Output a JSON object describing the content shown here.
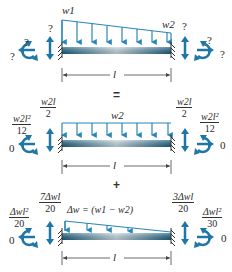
{
  "colors": {
    "beam": "#1f6b8e",
    "load": "#2a86b8",
    "reaction": "#1e76a6",
    "text": "#2a2a2a"
  },
  "operators": {
    "equals": "=",
    "plus": "+"
  },
  "panels": [
    {
      "id": "original",
      "load_type": "trapezoidal",
      "load_labels": {
        "left": "w1",
        "right": "w2"
      },
      "left_support": {
        "vertical": "?",
        "moment": "?",
        "horizontal": "?"
      },
      "right_support": {
        "vertical": "?",
        "moment": "?",
        "horizontal": "?"
      },
      "span_label": "l"
    },
    {
      "id": "uniform",
      "load_type": "uniform",
      "load_labels": {
        "center": "w2"
      },
      "left_support": {
        "vertical": {
          "num": "w2l",
          "den": "2"
        },
        "moment": {
          "num": "w2l²",
          "den": "12"
        },
        "horizontal": "0"
      },
      "right_support": {
        "vertical": {
          "num": "w2l",
          "den": "2"
        },
        "moment": {
          "num": "w2l²",
          "den": "12"
        },
        "horizontal": "0"
      },
      "span_label": "l"
    },
    {
      "id": "triangular",
      "load_type": "triangular",
      "load_labels": {
        "center": "Δw = (w1 − w2)"
      },
      "left_support": {
        "vertical": {
          "num": "7Δwl",
          "den": "20"
        },
        "moment": {
          "num": "Δwl²",
          "den": "20"
        },
        "horizontal": "0"
      },
      "right_support": {
        "vertical": {
          "num": "3Δwl",
          "den": "20"
        },
        "moment": {
          "num": "Δwl²",
          "den": "30"
        },
        "horizontal": "0"
      },
      "span_label": "l"
    }
  ]
}
